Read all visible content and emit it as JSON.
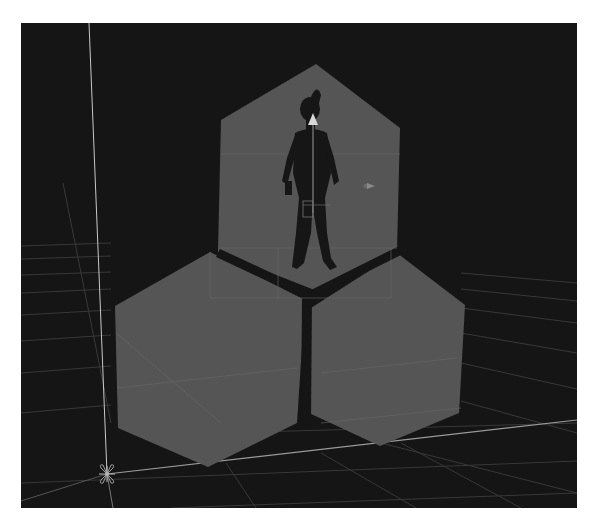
{
  "scene_view": {
    "background_color": "#151515",
    "page_background": "#ffffff",
    "tile_color": "#555555",
    "grid_color": "#3a3a3a",
    "axis_color": "#bdbdbd",
    "gizmo_color": "#8a8a8a"
  },
  "objects": [
    {
      "name": "hex-tile-top",
      "role": "hexagon tile with character"
    },
    {
      "name": "hex-tile-bottom-left",
      "role": "hexagon tile"
    },
    {
      "name": "hex-tile-bottom-right",
      "role": "hexagon tile"
    },
    {
      "name": "character",
      "role": "player character silhouette"
    },
    {
      "name": "camera-gizmo",
      "role": "camera icon"
    },
    {
      "name": "origin-gizmo",
      "role": "world origin marker"
    }
  ]
}
